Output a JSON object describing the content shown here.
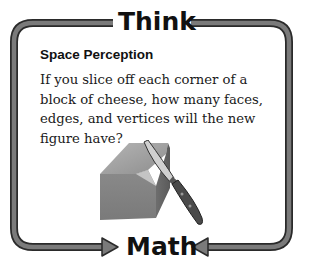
{
  "banner": {
    "top_label": "Think",
    "bottom_label": "Math"
  },
  "content": {
    "heading": "Space Perception",
    "question": "If you slice off each corner of a block of cheese, how many faces, edges, and vertices will the new figure have?"
  },
  "illustration": {
    "subject": "block of cheese with a knife slicing off a corner",
    "icons": [
      "cheese-block-icon",
      "knife-icon"
    ]
  },
  "colors": {
    "frame_fill": "#7a7a7a",
    "frame_outline": "#2a2a2a",
    "text": "#111111",
    "background": "#ffffff"
  }
}
